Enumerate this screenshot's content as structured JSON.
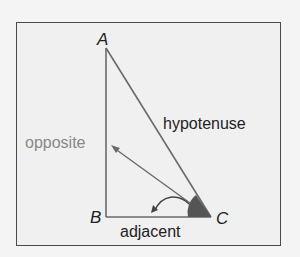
{
  "diagram": {
    "type": "right-triangle",
    "vertices": {
      "A": "A",
      "B": "B",
      "C": "C"
    },
    "sides": {
      "opposite": "opposite",
      "hypotenuse": "hypotenuse",
      "adjacent": "adjacent"
    },
    "colors": {
      "frame": "#4a4a4a",
      "background": "#f0f0f0",
      "lines": "#666666",
      "angle_fill": "#555555",
      "opposite_label": "#888888",
      "text": "#222222"
    }
  }
}
